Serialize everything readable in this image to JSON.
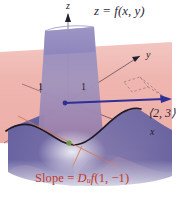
{
  "figure": {
    "title_label": "z = f(x, y)",
    "axis_labels": {
      "z": "z",
      "y": "y",
      "x": "x"
    },
    "tick_labels": {
      "left": "1",
      "right": "1"
    },
    "vector_label": "⟨2, 3⟩",
    "caption": {
      "prefix": "Slope = ",
      "operator": "D",
      "direction_subscript": "u",
      "function": "f",
      "argument": "(1, −1)"
    },
    "colors": {
      "background": "#ffffff",
      "vertical_plane_pink": "#efb4ae",
      "plane_pink_light": "#f2c4bf",
      "surface_purple": "#8c7fb4",
      "surface_purple_dark": "#6d5f96",
      "surface_blue": "#5a5a9e",
      "curtain_purple": "#9a8fc0",
      "vector_blue": "#2f2f95",
      "axis_dark": "#231f2e",
      "trace_curve": "#1d1a26",
      "caption_red": "#c0392b",
      "leader_orange": "#d4754f",
      "tangent_point_green": "#6f9a3f"
    }
  }
}
